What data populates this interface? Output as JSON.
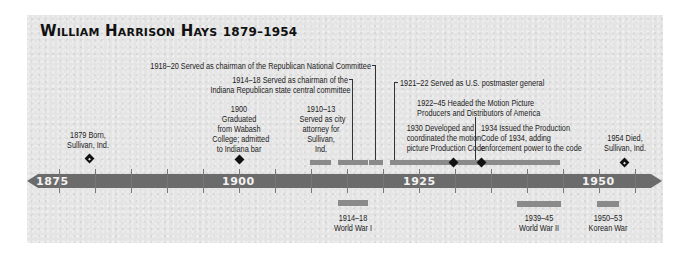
{
  "title": {
    "name": "William Harrison Hays",
    "years": "1879–1954"
  },
  "axis": {
    "color": "#6b6b6b",
    "year_labels": [
      "1875",
      "1900",
      "1925",
      "1950"
    ]
  },
  "events_above": {
    "born": {
      "line1": "1879 Born,",
      "line2": "Sullivan, Ind."
    },
    "graduated": {
      "line1": "1900",
      "line2": "Graduated",
      "line3": "from Wabash",
      "line4": "College; admitted",
      "line5": "to Indiana bar"
    },
    "city_attorney": {
      "line1": "1910–13",
      "line2": "Served as city",
      "line3": "attorney for",
      "line4": "Sullivan,",
      "line5": "Ind."
    },
    "state_committee": {
      "line1": "1914–18 Served as chairman of the",
      "line2": "Indiana Republican state central committee"
    },
    "national_committee": {
      "line1": "1918–20 Served as chairman of the Republican National Committee"
    },
    "postmaster": {
      "line1": "1921–22 Served as U.S. postmaster general"
    },
    "mppda": {
      "line1": "1922–45 Headed the Motion Picture",
      "line2": "Producers and Distributors of America"
    },
    "production_code_1930": {
      "line1": "1930 Developed and",
      "line2": "coordinated the motion",
      "line3": "picture Production Code"
    },
    "production_code_1934": {
      "line1": "1934 Issued the Production",
      "line2": "Code of 1934, adding",
      "line3": "enforcement power to the code"
    },
    "died": {
      "line1": "1954 Died,",
      "line2": "Sullivan, Ind."
    }
  },
  "events_below": {
    "ww1": {
      "years": "1914–18",
      "label": "World War I"
    },
    "ww2": {
      "years": "1939–45",
      "label": "World War II"
    },
    "korea": {
      "years": "1950–53",
      "label": "Korean War"
    }
  }
}
